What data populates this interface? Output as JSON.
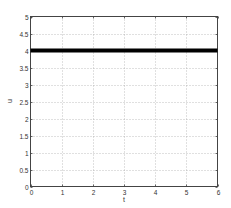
{
  "chart_data": {
    "type": "line",
    "title": "",
    "xlabel": "t",
    "ylabel": "u",
    "xlim": [
      0,
      6
    ],
    "ylim": [
      0,
      5
    ],
    "xticks": [
      0,
      1,
      2,
      3,
      4,
      5,
      6
    ],
    "yticks": [
      0,
      0.5,
      1,
      1.5,
      2,
      2.5,
      3,
      3.5,
      4,
      4.5,
      5
    ],
    "xtick_labels": [
      "0",
      "1",
      "2",
      "3",
      "4",
      "5",
      "6"
    ],
    "ytick_labels": [
      "0",
      "0.5",
      "1",
      "1.5",
      "2",
      "2.5",
      "3",
      "3.5",
      "4",
      "4.5",
      "5"
    ],
    "grid": true,
    "series": [
      {
        "name": "u",
        "x": [
          0,
          6
        ],
        "y": [
          4,
          4
        ],
        "color": "#000000",
        "linewidth": "thick"
      }
    ]
  },
  "labels": {
    "xlabel": "t",
    "ylabel": "u"
  }
}
